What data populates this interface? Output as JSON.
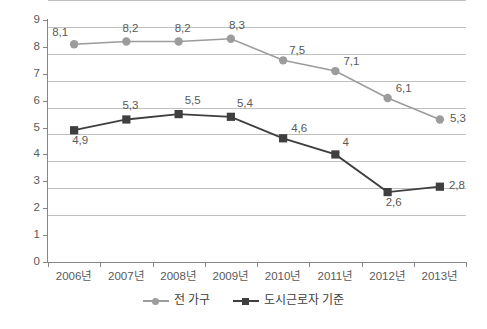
{
  "chart_data": {
    "type": "line",
    "title": "",
    "subtitle": "",
    "xlabel": "",
    "ylabel": "",
    "categories": [
      "2006년",
      "2007년",
      "2008년",
      "2009년",
      "2010년",
      "2011년",
      "2012년",
      "2013년"
    ],
    "ylim": [
      0,
      9
    ],
    "yticks": [
      "0",
      "1",
      "2",
      "3",
      "4",
      "5",
      "6",
      "7",
      "8",
      "9"
    ],
    "grid": true,
    "legend_position": "bottom",
    "decimal_separator": ",",
    "series": [
      {
        "name": "전 가구",
        "marker": "circle",
        "color": "#9c9c9c",
        "values": [
          8.1,
          8.2,
          8.2,
          8.3,
          7.5,
          7.1,
          6.1,
          5.3
        ],
        "labels": [
          "8,1",
          "8,2",
          "8,2",
          "8,3",
          "7,5",
          "7,1",
          "6,1",
          "5,3"
        ]
      },
      {
        "name": "도시근로자 기준",
        "marker": "square",
        "color": "#3f3f3f",
        "values": [
          4.9,
          5.3,
          5.5,
          5.4,
          4.6,
          4,
          2.6,
          2.8
        ],
        "labels": [
          "4,9",
          "5,3",
          "5,5",
          "5,4",
          "4,6",
          "4",
          "2,6",
          "2,8"
        ]
      }
    ]
  },
  "legend": {
    "items": [
      {
        "label": "전 가구"
      },
      {
        "label": "도시근로자 기준"
      }
    ]
  },
  "colors": {
    "series_all_households": "#9c9c9c",
    "series_urban_worker": "#3f3f3f",
    "gridline": "#bfbfbf",
    "axis": "#868686",
    "text": "#595959",
    "background": "#ffffff"
  }
}
